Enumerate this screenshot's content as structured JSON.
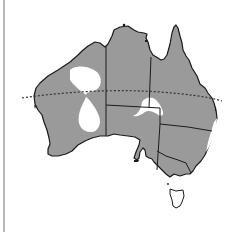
{
  "map": {
    "subject": "Australia",
    "description": "Map of Australia with shaded distribution area, state borders, and Tropic of Capricorn",
    "colors": {
      "shaded": "#9a9a9a",
      "unshaded": "#ffffff",
      "border": "#1a1a1a",
      "tropic_line": "#333333",
      "frame_line": "#b8b8b8"
    },
    "regions": [
      {
        "name": "Western Australia",
        "shaded": true
      },
      {
        "name": "Northern Territory",
        "shaded": true
      },
      {
        "name": "Queensland",
        "shaded": true
      },
      {
        "name": "South Australia",
        "shaded": true
      },
      {
        "name": "New South Wales",
        "shaded": true
      },
      {
        "name": "Victoria",
        "shaded": true
      },
      {
        "name": "Tasmania",
        "shaded": false
      }
    ],
    "unshaded_patches": [
      {
        "location": "north-west Western Australia (Pilbara)"
      },
      {
        "location": "central Western Australia"
      },
      {
        "location": "northern South Australia / southern NT border"
      },
      {
        "location": "east coast NSW strip"
      }
    ],
    "lines": {
      "tropic_of_capricorn": {
        "style": "dashed"
      }
    }
  }
}
